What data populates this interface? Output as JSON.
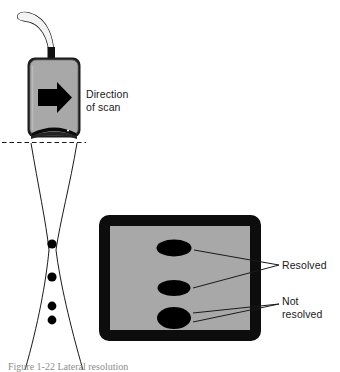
{
  "figure": {
    "kind": "ultrasound-beam-resolution-diagram",
    "caption": "Figure 1-22 Lateral resolution",
    "colors": {
      "background": "#ffffff",
      "probe_body": "#a8a8a8",
      "probe_outline": "#1c1c1c",
      "screen_gray": "#a8a8a8",
      "bezel_black": "#0d0d0d",
      "target_black": "#000000",
      "line_black": "#1a1a1a",
      "cable_fill": "#f2f2f2",
      "caption_gray": "#8d8d8d"
    }
  },
  "transducer": {
    "name": "ultrasound-transducer-probe",
    "arrow_direction": "right",
    "has_cable": true,
    "has_lens": true
  },
  "labels": {
    "direction_of_scan": "Direction\nof scan",
    "resolved": "Resolved",
    "not_resolved": "Not\nresolved"
  },
  "beam": {
    "name": "hourglass-beam-profile",
    "skin_line_style": "dashed",
    "focus_y": 250
  },
  "reflectors": {
    "name": "point-targets-in-beam",
    "count": 4,
    "points": [
      {
        "id": "target-1",
        "cx": 52,
        "cy": 244,
        "r": 4.6
      },
      {
        "id": "target-2",
        "cx": 52,
        "cy": 277,
        "r": 4.6
      },
      {
        "id": "target-3",
        "cx": 52,
        "cy": 306,
        "r": 4.4
      },
      {
        "id": "target-4",
        "cx": 52,
        "cy": 320,
        "r": 4.4
      }
    ]
  },
  "monitor": {
    "name": "ultrasound-display-monitor",
    "targets": [
      {
        "id": "display-echo-1",
        "cx": 174,
        "cy": 248,
        "rx": 17.5,
        "ry": 8.5,
        "state": "resolved"
      },
      {
        "id": "display-echo-2",
        "cx": 174,
        "cy": 288,
        "rx": 16.5,
        "ry": 8.0,
        "state": "resolved"
      },
      {
        "id": "display-echo-3",
        "cx": 174,
        "cy": 318,
        "rx": 17.0,
        "ry": 11.0,
        "state": "not-resolved"
      }
    ]
  }
}
